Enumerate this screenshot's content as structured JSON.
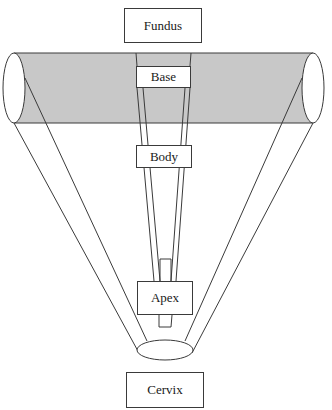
{
  "diagram": {
    "type": "schematic",
    "colors": {
      "cylinder_fill": "#c8c8c8",
      "stroke": "#3a3a3a",
      "background": "#ffffff"
    },
    "labels": {
      "fundus": "Fundus",
      "base": "Base",
      "body": "Body",
      "apex": "Apex",
      "cervix": "Cervix"
    }
  }
}
